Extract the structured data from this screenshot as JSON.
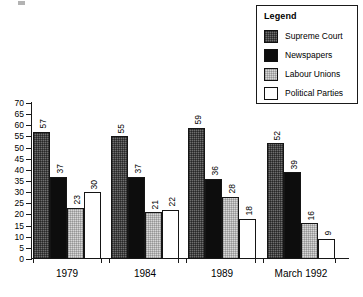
{
  "chart_data": {
    "type": "bar",
    "title": "",
    "xlabel": "",
    "ylabel": "",
    "categories": [
      "1979",
      "1984",
      "1989",
      "March 1992"
    ],
    "series": [
      {
        "name": "Supreme Court",
        "values": [
          57,
          55,
          59,
          52
        ],
        "color": "#6f6f6f",
        "pattern": "dark-checker"
      },
      {
        "name": "Newspapers",
        "values": [
          37,
          37,
          36,
          39
        ],
        "color": "#0d0d0d",
        "pattern": "solid-black"
      },
      {
        "name": "Labour Unions",
        "values": [
          23,
          21,
          28,
          16
        ],
        "color": "#d7d7d7",
        "pattern": "light-dotted"
      },
      {
        "name": "Political Parties",
        "values": [
          30,
          22,
          18,
          9
        ],
        "color": "#ffffff",
        "pattern": "white"
      }
    ],
    "ylim": [
      0,
      70
    ],
    "ytick_step": 5,
    "yticks": [
      0,
      5,
      10,
      15,
      20,
      25,
      30,
      35,
      40,
      45,
      50,
      55,
      60,
      65,
      70
    ],
    "grid": false,
    "show_value_labels": true,
    "value_label_rotation": 90,
    "legend": {
      "title": "Legend",
      "position": "top-right",
      "boxed": true
    }
  }
}
